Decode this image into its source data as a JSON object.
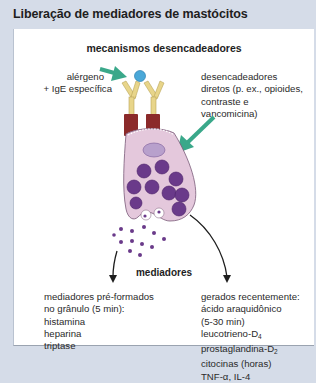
{
  "title": "Liberação de mediadores de mastócitos",
  "diagram": {
    "heading": "mecanismos desencadeadores",
    "trigger_allergen": [
      "alérgeno",
      "+ IgE específica"
    ],
    "trigger_direct": [
      "desencadeadores",
      "diretos (p. ex., opioides,",
      "contraste e",
      "vancomicina)"
    ],
    "mediators_label": "mediadores",
    "preformed": {
      "header": [
        "mediadores pré-formados",
        "no grânulo (5 min):"
      ],
      "items": [
        "histamina",
        "heparina",
        "triptase"
      ]
    },
    "new": {
      "header": "gerados recentemente:",
      "items": [
        "ácido araquidônico",
        "(5-30 min)",
        "leucotrieno-D",
        "prostaglandina-D",
        "citocinas (horas)",
        "TNF-α, IL-4"
      ],
      "subscripts": {
        "leucotrieno": "4",
        "prostaglandina": "2"
      }
    },
    "colors": {
      "arrow_green": "#3aa88a",
      "allergen_blue": "#4aa8d8",
      "antibody_tan": "#e8d58a",
      "receptor_maroon": "#8b2a2a",
      "cell_pink": "#e4c8dc",
      "nucleus_lavender": "#b8a0cc",
      "granule_purple": "#6a3a8a",
      "background": "#d5dce8"
    }
  }
}
